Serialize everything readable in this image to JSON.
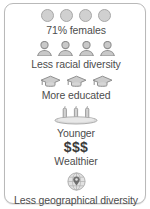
{
  "card": {
    "rows": [
      {
        "icon": "circle-face-icon",
        "icon_count": 4,
        "caption": "71% females"
      },
      {
        "icon": "person-icon",
        "icon_count": 4,
        "caption": "Less racial diversity"
      },
      {
        "icon": "graduation-cap-icon",
        "icon_count": 3,
        "caption": "More educated"
      },
      {
        "icon": "birthday-cake-icon",
        "icon_count": 1,
        "caption": "Younger"
      },
      {
        "icon": "money-symbol",
        "icon_count": 1,
        "caption": "Wealthier",
        "symbol": "$$$"
      },
      {
        "icon": "globe-pin-icon",
        "icon_count": 1,
        "caption": "Less geographical diversity"
      }
    ],
    "captions": {
      "females": "71% females",
      "racial": "Less racial diversity",
      "educated": "More educated",
      "younger": "Younger",
      "money": "$$$",
      "wealthier": "Wealthier",
      "geographical": "Less geographical diversity"
    },
    "colors": {
      "icon_fill": "#d0d0d0",
      "icon_stroke": "#9a9a9a",
      "text": "#4d4d4d",
      "money_text": "#3b3b3b",
      "border": "#b9b9b9",
      "background": "#ffffff"
    }
  }
}
